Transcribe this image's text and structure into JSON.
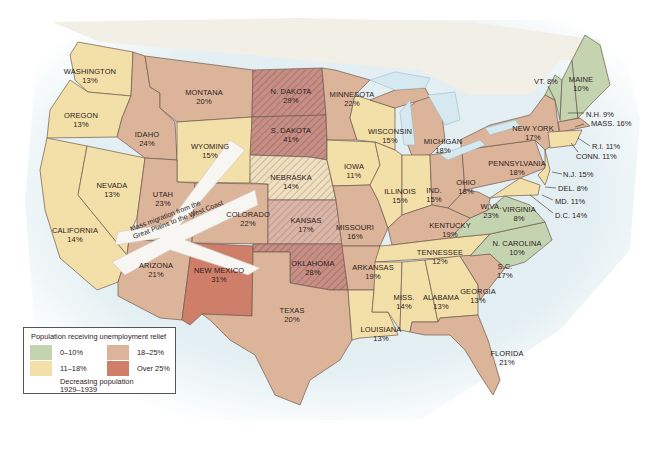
{
  "colors": {
    "range_0_10": "#c5d4b0",
    "range_11_18": "#f3dfa8",
    "range_18_25": "#dcb49a",
    "range_over_25": "#cf7f69",
    "hatch": "#b9a0a0",
    "water": "#d8eaf0",
    "canada": "#f2efe7",
    "border": "#6e5a50"
  },
  "states": [
    {
      "name": "WASHINGTON",
      "pct": "13%"
    },
    {
      "name": "OREGON",
      "pct": "13%"
    },
    {
      "name": "CALIFORNIA",
      "pct": "14%"
    },
    {
      "name": "NEVADA",
      "pct": "13%"
    },
    {
      "name": "IDAHO",
      "pct": "24%"
    },
    {
      "name": "MONTANA",
      "pct": "20%"
    },
    {
      "name": "WYOMING",
      "pct": "15%"
    },
    {
      "name": "UTAH",
      "pct": "23%"
    },
    {
      "name": "ARIZONA",
      "pct": "21%"
    },
    {
      "name": "COLORADO",
      "pct": "22%"
    },
    {
      "name": "NEW MEXICO",
      "pct": "31%"
    },
    {
      "name": "N. DAKOTA",
      "pct": "29%"
    },
    {
      "name": "S. DAKOTA",
      "pct": "41%"
    },
    {
      "name": "NEBRASKA",
      "pct": "14%"
    },
    {
      "name": "KANSAS",
      "pct": "17%"
    },
    {
      "name": "OKLAHOMA",
      "pct": "28%"
    },
    {
      "name": "TEXAS",
      "pct": "20%"
    },
    {
      "name": "MINNESOTA",
      "pct": "22%"
    },
    {
      "name": "IOWA",
      "pct": "11%"
    },
    {
      "name": "MISSOURI",
      "pct": "16%"
    },
    {
      "name": "ARKANSAS",
      "pct": "19%"
    },
    {
      "name": "LOUISIANA",
      "pct": "13%"
    },
    {
      "name": "WISCONSIN",
      "pct": "15%"
    },
    {
      "name": "ILLINOIS",
      "pct": "15%"
    },
    {
      "name": "MICHIGAN",
      "pct": "18%"
    },
    {
      "name": "IND.",
      "pct": "15%"
    },
    {
      "name": "OHIO",
      "pct": "18%"
    },
    {
      "name": "KENTUCKY",
      "pct": "19%"
    },
    {
      "name": "TENNESSEE",
      "pct": "12%"
    },
    {
      "name": "MISS.",
      "pct": "14%"
    },
    {
      "name": "ALABAMA",
      "pct": "13%"
    },
    {
      "name": "GEORGIA",
      "pct": "13%"
    },
    {
      "name": "FLORIDA",
      "pct": "21%"
    },
    {
      "name": "S.C.",
      "pct": "17%"
    },
    {
      "name": "N. CAROLINA",
      "pct": "10%"
    },
    {
      "name": "VIRGINIA",
      "pct": "8%"
    },
    {
      "name": "W.VA.",
      "pct": "23%"
    },
    {
      "name": "PENNSYLVANIA",
      "pct": "18%"
    },
    {
      "name": "NEW YORK",
      "pct": "17%"
    },
    {
      "name": "MAINE",
      "pct": "10%"
    }
  ],
  "callouts": [
    {
      "text": "VT. 8%"
    },
    {
      "text": "N.H. 9%"
    },
    {
      "text": "MASS. 16%"
    },
    {
      "text": "R.I. 11%"
    },
    {
      "text": "CONN. 11%"
    },
    {
      "text": "N.J. 15%"
    },
    {
      "text": "DEL. 8%"
    },
    {
      "text": "MD. 11%"
    },
    {
      "text": "D.C. 14%"
    }
  ],
  "arrow": {
    "line1": "Mass migration from the",
    "line2": "Great Plains to the West Coast"
  },
  "legend": {
    "title": "Population receiving unemployment relief",
    "items": [
      {
        "label": "0–10%"
      },
      {
        "label": "18–25%"
      },
      {
        "label": "11–18%"
      },
      {
        "label": "Over 25%"
      }
    ],
    "hatch_label_1": "Decreasing population",
    "hatch_label_2": "1929–1939"
  }
}
